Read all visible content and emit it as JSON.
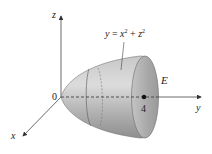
{
  "figure": {
    "axes": {
      "z_label": "z",
      "y_label": "y",
      "x_label": "x",
      "origin_label": "0"
    },
    "surface": {
      "equation": {
        "var": "y",
        "eq": " = ",
        "x": "x",
        "x_exp": "2",
        "plus": " + ",
        "z": "z",
        "z_exp": "2"
      },
      "region_label": "E",
      "point_label": "4"
    },
    "colors": {
      "surface_light": "#d8d8d8",
      "surface_mid": "#b4b4b4",
      "surface_dark": "#8a8a8a",
      "opening_fill": "#a9a9a9",
      "axis": "#333333",
      "text": "#222222"
    }
  }
}
